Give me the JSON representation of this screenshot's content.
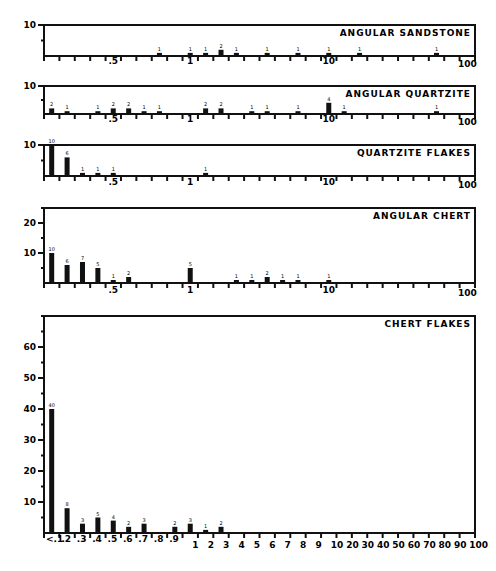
{
  "chart_data": [
    {
      "type": "bar",
      "title": "ANGULAR SANDSTONE",
      "ylim": [
        0,
        10
      ],
      "yticks": [
        10
      ],
      "xtick_labels": [
        ".5",
        "1",
        "10",
        "100"
      ],
      "bins": [
        7,
        9,
        10,
        11,
        12,
        14,
        16,
        18,
        20,
        25
      ],
      "values": [
        1,
        1,
        1,
        2,
        1,
        1,
        1,
        1,
        1,
        1
      ]
    },
    {
      "type": "bar",
      "title": "ANGULAR QUARTZITE",
      "ylim": [
        0,
        10
      ],
      "yticks": [
        10
      ],
      "xtick_labels": [
        ".5",
        "1",
        "10",
        "100"
      ],
      "bins": [
        0,
        1,
        3,
        4,
        5,
        6,
        7,
        10,
        11,
        13,
        14,
        16,
        18,
        19,
        25
      ],
      "values": [
        2,
        1,
        1,
        2,
        2,
        1,
        1,
        2,
        2,
        1,
        1,
        1,
        4,
        1,
        1
      ]
    },
    {
      "type": "bar",
      "title": "QUARTZITE FLAKES",
      "ylim": [
        0,
        10
      ],
      "yticks": [
        10
      ],
      "xtick_labels": [
        ".5",
        "1",
        "10",
        "100"
      ],
      "bins": [
        0,
        1,
        2,
        3,
        4,
        10
      ],
      "values": [
        10,
        6,
        1,
        1,
        1,
        1
      ]
    },
    {
      "type": "bar",
      "title": "ANGULAR CHERT",
      "ylim": [
        0,
        25
      ],
      "yticks": [
        10,
        20
      ],
      "xtick_labels": [
        ".5",
        "1",
        "10",
        "100"
      ],
      "bins": [
        0,
        1,
        2,
        3,
        4,
        5,
        9,
        12,
        13,
        14,
        15,
        16,
        18
      ],
      "values": [
        10,
        6,
        7,
        5,
        1,
        2,
        5,
        1,
        1,
        2,
        1,
        1,
        1
      ]
    },
    {
      "type": "bar",
      "title": "CHERT FLAKES",
      "ylim": [
        0,
        70
      ],
      "yticks": [
        10,
        20,
        30,
        40,
        50,
        60
      ],
      "categories": [
        "<.1",
        ".2",
        ".3",
        ".4",
        ".5",
        ".6",
        ".7",
        ".8",
        ".9",
        "1",
        "2",
        "3",
        "4",
        "5",
        "6",
        "7",
        "8",
        "9",
        "10",
        "20",
        "30",
        "40",
        "50",
        "60",
        "70",
        "80",
        "90",
        "100"
      ],
      "bins": [
        0,
        1,
        2,
        3,
        4,
        5,
        6,
        8,
        9,
        10,
        11
      ],
      "values": [
        40,
        8,
        3,
        5,
        4,
        2,
        3,
        2,
        3,
        1,
        2
      ]
    }
  ]
}
